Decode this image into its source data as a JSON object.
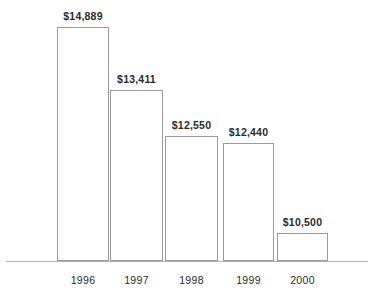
{
  "chart_data": {
    "type": "bar",
    "title": "",
    "subtitle": "",
    "xlabel": "",
    "ylabel": "",
    "categories": [
      "1996",
      "1997",
      "1998",
      "1999",
      "2000"
    ],
    "values": [
      14889,
      13411,
      12550,
      12440,
      10500
    ],
    "value_labels": [
      "$14,889",
      "$13,411",
      "$12,550",
      "$12,440",
      "$10,500"
    ],
    "legend": [],
    "legend_position": "none",
    "grid": false,
    "axis": {
      "x_axis_visible": true,
      "y_axis_visible": false,
      "y_tick_labels": [],
      "baseline_truncated": true
    },
    "style": {
      "bar_fill": "#ffffff",
      "bar_stroke": "#9a9a9a",
      "text_color": "#2b2b2b",
      "axis_color": "#b0b0b0",
      "background": "#ffffff"
    },
    "geometry": {
      "baseline_y": 261,
      "axis_x_start": 6,
      "axis_x_end": 368,
      "tick_label_y": 274,
      "bars": [
        {
          "x": 57,
          "width": 52,
          "top": 27,
          "label_y": 10
        },
        {
          "x": 110,
          "width": 53,
          "top": 90,
          "label_y": 73
        },
        {
          "x": 165,
          "width": 53,
          "top": 136,
          "label_y": 119
        },
        {
          "x": 223,
          "width": 51,
          "top": 143,
          "label_y": 126
        },
        {
          "x": 277,
          "width": 51,
          "top": 233,
          "label_y": 216
        }
      ]
    }
  }
}
